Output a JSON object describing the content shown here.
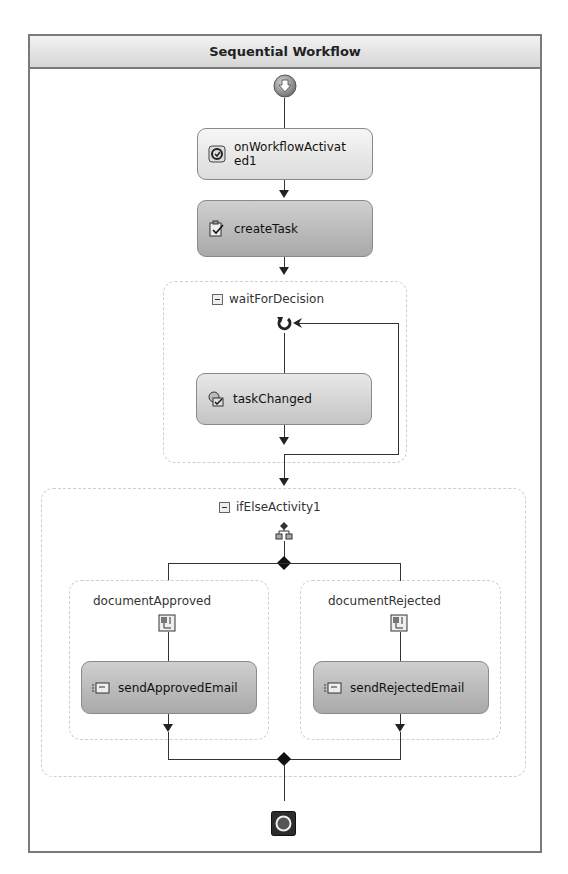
{
  "workflow": {
    "title": "Sequential Workflow",
    "start_icon": "start-arrow-icon",
    "end_icon": "end-stop-icon"
  },
  "activities": {
    "onWorkflowActivated": {
      "label_line1": "onWorkflowActivat",
      "label_line2": "ed1",
      "icon": "workflow-activated-icon"
    },
    "createTask": {
      "label": "createTask",
      "icon": "create-task-icon"
    },
    "waitForDecision": {
      "label": "waitForDecision",
      "icon": "while-loop-icon"
    },
    "taskChanged": {
      "label": "taskChanged",
      "icon": "task-changed-icon"
    },
    "ifElse": {
      "label": "ifElseActivity1",
      "icon": "ifelse-branch-icon"
    },
    "documentApproved": {
      "label": "documentApproved",
      "icon": "sequence-icon"
    },
    "sendApprovedEmail": {
      "label": "sendApprovedEmail",
      "icon": "email-icon"
    },
    "documentRejected": {
      "label": "documentRejected",
      "icon": "sequence-icon"
    },
    "sendRejectedEmail": {
      "label": "sendRejectedEmail",
      "icon": "email-icon"
    }
  },
  "colors": {
    "frame_border": "#7a7a7a",
    "connector": "#333333",
    "container_border": "#cfcfcf"
  }
}
